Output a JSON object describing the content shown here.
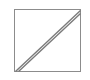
{
  "figure": {
    "background_color": "#ffffff",
    "canvas": {
      "width": 90,
      "height": 80
    },
    "shapes": {
      "square": {
        "name": "square-outline",
        "x": 14.5,
        "y": 9.5,
        "width": 66,
        "height": 62,
        "stroke_color": "#8c8c8c",
        "stroke_width": 1.6,
        "fill_color": "#ffffff"
      },
      "diagonal_lower": {
        "name": "diagonal-line-lower",
        "x1": 15.5,
        "y1": 71.5,
        "x2": 80.5,
        "y2": 10.5,
        "stroke_color": "#7a7a7a",
        "stroke_width": 1.4
      },
      "diagonal_upper": {
        "name": "diagonal-line-upper",
        "x1": 18.5,
        "y1": 71.5,
        "x2": 80.5,
        "y2": 13.5,
        "stroke_color": "#7a7a7a",
        "stroke_width": 1.4
      }
    }
  }
}
